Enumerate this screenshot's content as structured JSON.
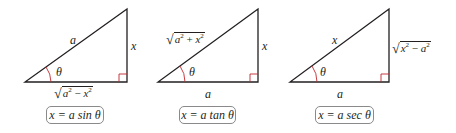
{
  "diagrams": [
    {
      "hypotenuse": "a",
      "opposite": "x",
      "adjacent_radicand": [
        "a",
        "2",
        " − ",
        "x",
        "2"
      ],
      "angle": "θ",
      "formula": "x = a sin θ"
    },
    {
      "hypotenuse_radicand": [
        "a",
        "2",
        " + ",
        "x",
        "2"
      ],
      "opposite": "x",
      "adjacent": "a",
      "angle": "θ",
      "formula": "x = a tan θ"
    },
    {
      "hypotenuse": "x",
      "opposite_radicand": [
        "x",
        "2",
        " − ",
        "a",
        "2"
      ],
      "adjacent": "a",
      "angle": "θ",
      "formula": "x = a sec θ"
    }
  ],
  "colors": {
    "line": "#231f20",
    "right_angle": "#c1272d",
    "angle_arc": "#c1272d",
    "box_border": "#8a8a8a"
  }
}
